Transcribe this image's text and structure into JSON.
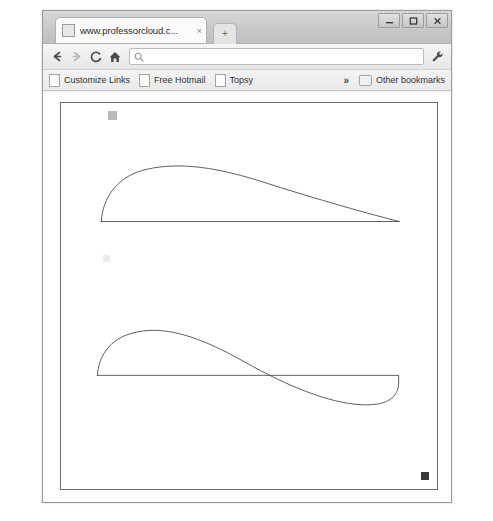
{
  "window": {
    "controls": [
      {
        "name": "minimize-button",
        "glyph": "minimize"
      },
      {
        "name": "maximize-button",
        "glyph": "maximize"
      },
      {
        "name": "close-button",
        "glyph": "close"
      }
    ]
  },
  "tab": {
    "title": "www.professorcloud.c...",
    "close_label": "×",
    "favicon": "page-icon"
  },
  "new_tab": {
    "label": "+"
  },
  "toolbar": {
    "back_label": "←",
    "forward_label": "→",
    "reload_label": "C",
    "home_label": "home-icon",
    "wrench_label": "wrench-icon",
    "omnibox": {
      "value": "",
      "placeholder": "",
      "icon": "search-icon"
    }
  },
  "bookmarks": {
    "items": [
      {
        "label": "Customize Links",
        "icon": "page-icon"
      },
      {
        "label": "Free Hotmail",
        "icon": "page-icon"
      },
      {
        "label": "Topsy",
        "icon": "page-icon"
      }
    ],
    "overflow_label": "»",
    "other": {
      "label": "Other bookmarks",
      "icon": "folder-icon"
    }
  },
  "page": {
    "title": "",
    "markers": [
      {
        "name": "marker-top-left",
        "color": "#b9b9b9"
      },
      {
        "name": "marker-middle-left",
        "color": "#ededed"
      },
      {
        "name": "marker-bottom-right",
        "color": "#3b3b3b"
      }
    ],
    "shapes": [
      {
        "name": "airfoil-upper",
        "description": "cambered airfoil section, flat chord line, rounded leading edge, sharp trailing edge",
        "stroke": "#4a4a4a",
        "stroke_width": 0.9,
        "path": "M 41 121 C 42 96, 58 76, 82 69 C 114 60, 152 64, 200 79 C 262 99, 316 114, 344 121 L 41 121 Z"
      },
      {
        "name": "airfoil-reflexed",
        "description": "reflexed S-shaped airfoil section crossing the chord line, rounded trailing edge",
        "stroke": "#4a4a4a",
        "stroke_width": 0.9,
        "path": "M 37 278 C 38 258, 50 241, 72 235 C 104 226, 140 238, 186 264 C 232 290, 272 306, 305 308 C 328 309, 341 303, 343 288 L 343 278 L 37 278 Z"
      }
    ]
  }
}
